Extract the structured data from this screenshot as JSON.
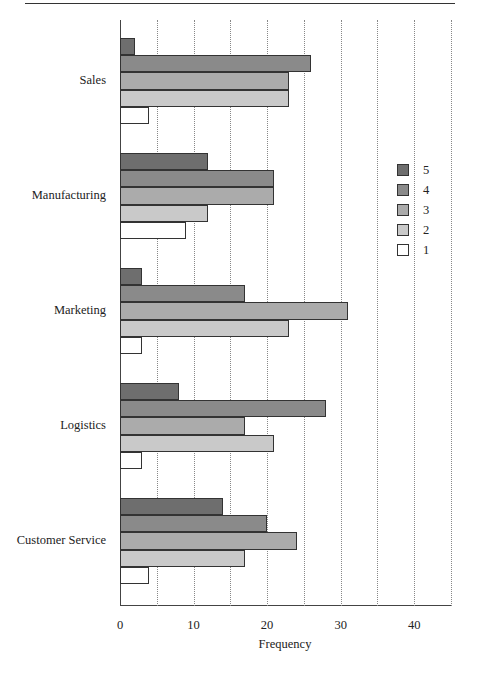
{
  "chart_data": {
    "type": "bar",
    "orientation": "horizontal",
    "title": "",
    "xlabel": "Frequency",
    "ylabel": "",
    "xlim": [
      0,
      45
    ],
    "x_ticks": [
      0,
      10,
      20,
      30,
      40
    ],
    "grid": {
      "x": true,
      "step": 5,
      "style": "dotted"
    },
    "legend_position": "right",
    "categories": [
      "Sales",
      "Manufacturing",
      "Marketing",
      "Logistics",
      "Customer Service"
    ],
    "series": [
      {
        "name": "5",
        "color": "#6e6e6e",
        "values": [
          2,
          12,
          3,
          8,
          14
        ]
      },
      {
        "name": "4",
        "color": "#8a8a8a",
        "values": [
          26,
          21,
          17,
          28,
          20
        ]
      },
      {
        "name": "3",
        "color": "#ababab",
        "values": [
          23,
          21,
          31,
          17,
          24
        ]
      },
      {
        "name": "2",
        "color": "#c9c9c9",
        "values": [
          23,
          12,
          23,
          21,
          17
        ]
      },
      {
        "name": "1",
        "color": "#ffffff",
        "values": [
          4,
          9,
          3,
          3,
          4
        ]
      }
    ]
  },
  "axis": {
    "x_title": "Frequency",
    "tick_labels": [
      "0",
      "10",
      "20",
      "30",
      "40"
    ]
  },
  "legend": {
    "items": [
      {
        "label": "5",
        "color": "#6e6e6e"
      },
      {
        "label": "4",
        "color": "#8a8a8a"
      },
      {
        "label": "3",
        "color": "#ababab"
      },
      {
        "label": "2",
        "color": "#c9c9c9"
      },
      {
        "label": "1",
        "color": "#ffffff"
      }
    ]
  }
}
